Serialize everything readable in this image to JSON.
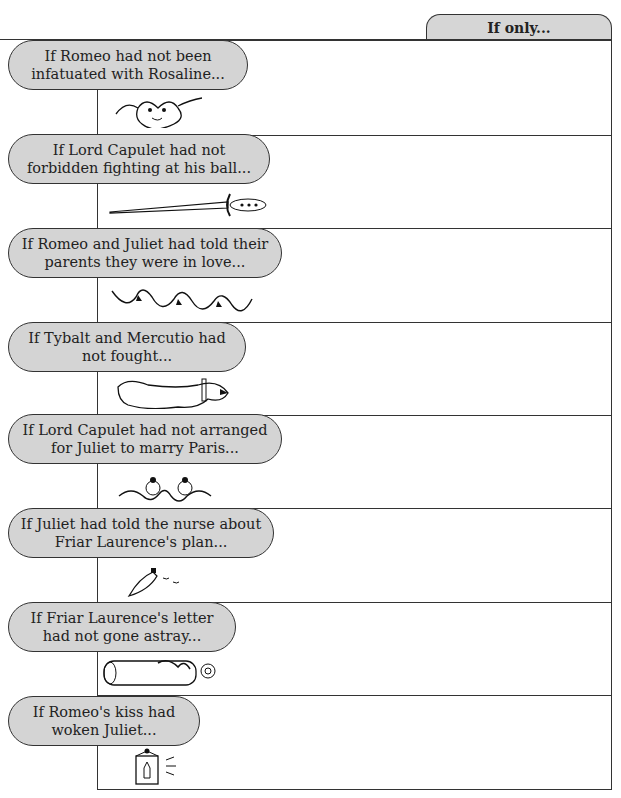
{
  "header": {
    "tab_label": "If only..."
  },
  "rows": [
    {
      "prompt": "If Romeo had not been infatuated with Rosaline...",
      "answer": "",
      "icon": "smiling-face-with-ribbons-icon"
    },
    {
      "prompt": "If Lord Capulet had not forbidden fighting at his ball...",
      "answer": "",
      "icon": "dagger-icon"
    },
    {
      "prompt": "If Romeo and Juliet had told their parents they were in love...",
      "answer": "",
      "icon": "floral-vine-icon"
    },
    {
      "prompt": "If Tybalt and Mercutio had not fought...",
      "answer": "",
      "icon": "snarling-dog-icon"
    },
    {
      "prompt": "If Lord Capulet had not arranged for Juliet to marry Paris...",
      "answer": "",
      "icon": "twin-birds-knot-icon"
    },
    {
      "prompt": "If Juliet had told the nurse about Friar Laurence's plan...",
      "answer": "",
      "icon": "vial-icon"
    },
    {
      "prompt": "If Friar Laurence's letter had not gone astray...",
      "answer": "",
      "icon": "scroll-letter-icon"
    },
    {
      "prompt": "If Romeo's kiss had woken Juliet...",
      "answer": "",
      "icon": "lantern-icon"
    }
  ]
}
